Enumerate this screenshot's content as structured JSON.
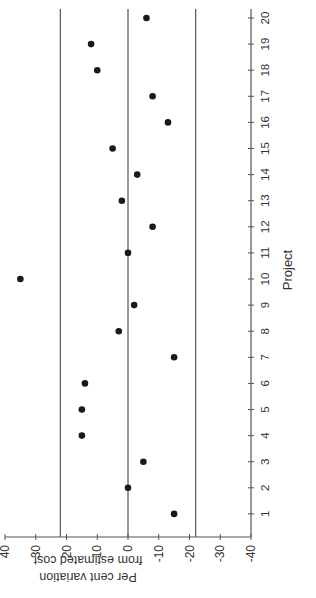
{
  "chart_data": {
    "type": "scatter",
    "orientation": "rotated-90-clockwise",
    "title": "",
    "xlabel": "Project",
    "ylabel": "Per cent variation from estimated cost",
    "ylabel_lines": [
      "Per cent variation",
      "from estimated cost"
    ],
    "x": [
      1,
      2,
      3,
      4,
      5,
      6,
      7,
      8,
      9,
      10,
      11,
      12,
      13,
      14,
      15,
      16,
      17,
      18,
      19,
      20
    ],
    "values": [
      -15,
      0,
      -5,
      15,
      15,
      14,
      -15,
      3,
      -2,
      35,
      0,
      -8,
      2,
      -3,
      5,
      -13,
      -8,
      10,
      12,
      -6
    ],
    "xticks": [
      "1",
      "2",
      "3",
      "4",
      "5",
      "6",
      "7",
      "8",
      "9",
      "10",
      "11",
      "12",
      "13",
      "14",
      "15",
      "16",
      "17",
      "18",
      "19",
      "20"
    ],
    "yticks": [
      "40",
      "30",
      "20",
      "10",
      "0",
      "-10",
      "-20",
      "-30",
      "-40"
    ],
    "ytick_values": [
      40,
      30,
      20,
      10,
      0,
      -10,
      -20,
      -30,
      -40
    ],
    "ylim": [
      -40,
      40
    ],
    "xlim": [
      0.5,
      20.5
    ],
    "reference_lines": [
      22,
      0,
      -22
    ],
    "grid": false,
    "legend": null,
    "colors": {
      "points": "#1a1a1a",
      "lines": "#555555",
      "axis": "#555555"
    }
  }
}
